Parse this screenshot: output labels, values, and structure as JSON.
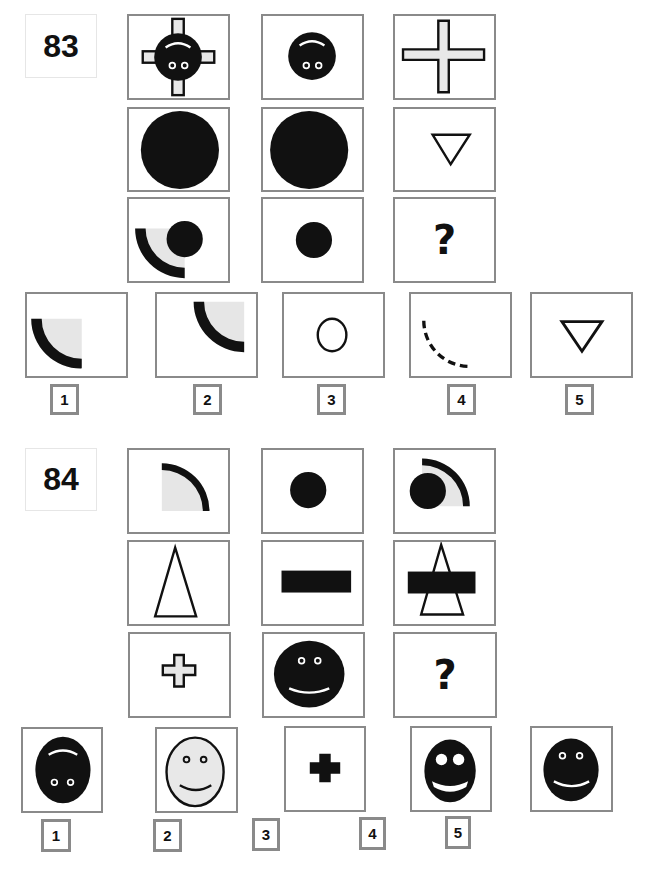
{
  "puzzles": [
    {
      "number": "83",
      "grid": [
        [
          "cross-with-upside-down-face",
          "upside-down-face",
          "outline-cross"
        ],
        [
          "large-filled-circle",
          "large-filled-circle",
          "small-down-triangle"
        ],
        [
          "arc-with-dot",
          "small-filled-dot",
          "question-mark"
        ]
      ],
      "question_mark": "?",
      "answers": [
        {
          "number": "1",
          "shape": "lower-left-quarter-arc"
        },
        {
          "number": "2",
          "shape": "upper-right-quarter-arc"
        },
        {
          "number": "3",
          "shape": "outline-circle"
        },
        {
          "number": "4",
          "shape": "dashed-arc"
        },
        {
          "number": "5",
          "shape": "down-triangle"
        }
      ]
    },
    {
      "number": "84",
      "grid": [
        [
          "quarter-arc",
          "filled-dot",
          "arc-with-dot"
        ],
        [
          "tall-triangle",
          "black-bar",
          "triangle-with-bar"
        ],
        [
          "small-outline-cross",
          "smiley-face",
          "question-mark"
        ]
      ],
      "question_mark": "?",
      "answers": [
        {
          "number": "1",
          "shape": "upside-down-face"
        },
        {
          "number": "2",
          "shape": "light-smiley"
        },
        {
          "number": "3",
          "shape": "black-cross"
        },
        {
          "number": "4",
          "shape": "big-eye-smiley"
        },
        {
          "number": "5",
          "shape": "smiley-face"
        }
      ]
    }
  ]
}
